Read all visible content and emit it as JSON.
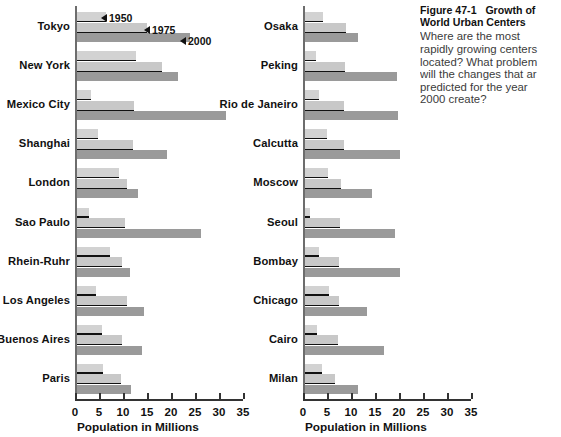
{
  "caption": {
    "figure_label": "Figure 47-1",
    "figure_title": "Growth of",
    "title_line2": "World Urban Centers",
    "body_lines": [
      "Where are the most",
      "rapidly growing centers",
      "located? What problem",
      "will the changes that ar",
      "predicted for the year",
      "2000 create?"
    ]
  },
  "legend": {
    "items": [
      {
        "label": "1950",
        "color": "#d2d2d2"
      },
      {
        "label": "1975",
        "color": "#c8c8c8"
      },
      {
        "label": "2000",
        "color": "#9a9a9a"
      }
    ]
  },
  "axis": {
    "title": "Population in Millions",
    "ticks": [
      "0",
      "5",
      "10",
      "15",
      "20",
      "25",
      "30",
      "35"
    ],
    "min": 0,
    "max": 35
  },
  "chart_data": {
    "type": "bar",
    "orientation": "horizontal",
    "xlabel": "Population in Millions",
    "ylabel": "",
    "xlim": [
      0,
      35
    ],
    "grid": false,
    "legend_position": "inline-annotation-top-left",
    "series": [
      {
        "name": "1950",
        "color": "#d2d2d2"
      },
      {
        "name": "1975",
        "color": "#c8c8c8"
      },
      {
        "name": "2000",
        "color": "#9a9a9a"
      }
    ],
    "panels": [
      {
        "name": "left",
        "categories": [
          "Tokyo",
          "New York",
          "Mexico City",
          "Shanghai",
          "London",
          "Sao Paulo",
          "Rhein-Ruhr",
          "Los Angeles",
          "Buenos Aires",
          "Paris"
        ],
        "values": {
          "1950": [
            6.0,
            12.3,
            3.0,
            4.3,
            8.7,
            2.5,
            6.8,
            4.0,
            5.2,
            5.4
          ],
          "1975": [
            14.5,
            17.8,
            11.9,
            11.6,
            10.4,
            10.0,
            9.3,
            10.5,
            9.3,
            9.2
          ],
          "2000": [
            23.5,
            21.0,
            31.0,
            18.8,
            12.7,
            25.8,
            11.1,
            14.0,
            13.5,
            11.3
          ]
        }
      },
      {
        "name": "right",
        "categories": [
          "Osaka",
          "Peking",
          "Rio de Janeiro",
          "Calcutta",
          "Moscow",
          "Seoul",
          "Bombay",
          "Chicago",
          "Cairo",
          "Milan"
        ],
        "values": {
          "1950": [
            3.8,
            2.2,
            2.9,
            4.5,
            4.8,
            1.0,
            2.9,
            4.9,
            2.4,
            3.6
          ],
          "1975": [
            8.6,
            8.4,
            8.2,
            8.1,
            7.6,
            7.3,
            7.1,
            7.1,
            6.9,
            6.2
          ],
          "2000": [
            11.1,
            19.1,
            19.4,
            19.7,
            13.9,
            18.7,
            19.8,
            13.0,
            16.4,
            11.1
          ]
        }
      }
    ]
  }
}
